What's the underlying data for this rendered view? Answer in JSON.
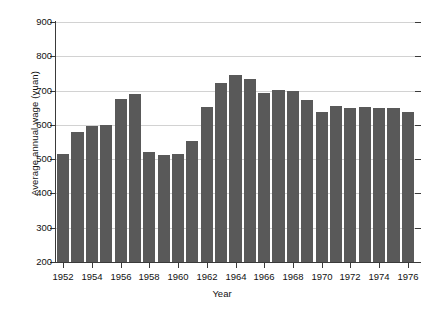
{
  "chart_data": {
    "type": "bar",
    "title": "",
    "xlabel": "Year",
    "ylabel": "Average annual wage (yuan)",
    "ylim": [
      200,
      900
    ],
    "ytick_values": [
      200,
      300,
      400,
      500,
      600,
      700,
      800,
      900
    ],
    "ytick_labels": [
      "200",
      "300",
      "400",
      "500",
      "600",
      "700",
      "800",
      "900"
    ],
    "xtick_labels": [
      "1952",
      "1954",
      "1956",
      "1958",
      "1960",
      "1962",
      "1964",
      "1966",
      "1968",
      "1970",
      "1972",
      "1974",
      "1976"
    ],
    "grid": true,
    "legend": false,
    "bar_color": "#595959",
    "categories": [
      "1952",
      "1953",
      "1954",
      "1955",
      "1956",
      "1957",
      "1958",
      "1959",
      "1960",
      "1961",
      "1962",
      "1963",
      "1964",
      "1965",
      "1966",
      "1967",
      "1968",
      "1969",
      "1970",
      "1971",
      "1972",
      "1973",
      "1974",
      "1975",
      "1976"
    ],
    "values": [
      515,
      578,
      598,
      600,
      675,
      690,
      522,
      512,
      515,
      553,
      652,
      723,
      745,
      733,
      694,
      703,
      700,
      672,
      638,
      654,
      650,
      652,
      648,
      648,
      637
    ]
  }
}
